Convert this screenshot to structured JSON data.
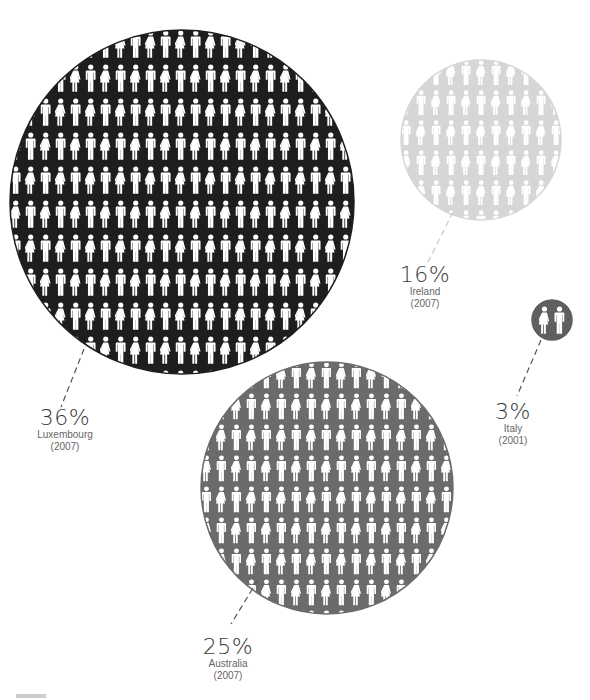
{
  "chart_data": {
    "type": "bubble",
    "title": "",
    "series": [
      {
        "name": "Luxembourg",
        "value": 36,
        "unit": "%",
        "year": "2007",
        "color": "#1e1e1e"
      },
      {
        "name": "Australia",
        "value": 25,
        "unit": "%",
        "year": "2007",
        "color": "#6b6b6b"
      },
      {
        "name": "Ireland",
        "value": 16,
        "unit": "%",
        "year": "2007",
        "color": "#d6d6d6"
      },
      {
        "name": "Italy",
        "value": 3,
        "unit": "%",
        "year": "2001",
        "color": "#5f5f5f"
      }
    ],
    "legend": "none",
    "grid": false
  },
  "bubbles": [
    {
      "id": "luxembourg",
      "pct": "36%",
      "country": "Luxembourg",
      "year": "(2007)",
      "cx": 182,
      "cy": 202,
      "r": 172,
      "fill": "#1e1e1e",
      "fig_dx": 15,
      "fig_dy": 34,
      "fig_scale": 1.0,
      "leader": [
        84,
        349,
        61,
        407
      ],
      "label_x": 58,
      "label_y": 408
    },
    {
      "id": "ireland",
      "pct": "16%",
      "country": "Ireland",
      "year": "(2007)",
      "cx": 481,
      "cy": 140,
      "r": 80,
      "fill": "#d6d6d6",
      "fig_dx": 15,
      "fig_dy": 30,
      "fig_scale": 0.9,
      "leader": [
        453,
        212,
        428,
        262
      ],
      "label_x": 423,
      "label_y": 267
    },
    {
      "id": "italy",
      "pct": "3%",
      "country": "Italy",
      "year": "(2001)",
      "cx": 552,
      "cy": 320,
      "r": 20,
      "fill": "#5f5f5f",
      "fig_dx": 14,
      "fig_dy": 40,
      "fig_scale": 1.0,
      "leader": [
        541,
        340,
        517,
        396
      ],
      "label_x": 514,
      "label_y": 403
    },
    {
      "id": "australia",
      "pct": "25%",
      "country": "Australia",
      "year": "(2007)",
      "cx": 327,
      "cy": 488,
      "r": 126,
      "fill": "#6b6b6b",
      "fig_dx": 15,
      "fig_dy": 31,
      "fig_scale": 0.95,
      "leader": [
        258,
        580,
        231,
        624
      ],
      "label_x": 228,
      "label_y": 636
    }
  ],
  "figure_color": "#ffffff",
  "leader_color": "#555555"
}
